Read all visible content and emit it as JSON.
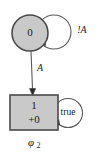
{
  "diagram": {
    "caption": "φ",
    "caption_subscript": "2",
    "colors": {
      "node_fill": "#c9c9c9",
      "node_stroke": "#4a4a4a",
      "edge_stroke": "#5a5a5a",
      "text": "#1a1a1a",
      "background": "#ffffff"
    },
    "nodes": [
      {
        "id": "state-0",
        "shape": "circle",
        "label": "0",
        "self_loop_label": "!A"
      },
      {
        "id": "state-1",
        "shape": "rectangle",
        "label_line1": "1",
        "label_line2": "+0",
        "self_loop_label": "true"
      }
    ],
    "edges": [
      {
        "id": "edge-0-to-1",
        "from": "state-0",
        "to": "state-1",
        "label": "A"
      }
    ]
  }
}
